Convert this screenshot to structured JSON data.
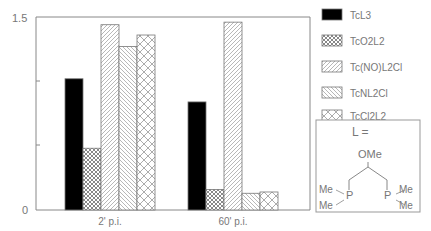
{
  "chart_data": {
    "type": "bar",
    "title": "",
    "xlabel": "",
    "ylabel": "",
    "ylim": [
      0,
      1.5
    ],
    "yticks": [
      0,
      0.5,
      1.0,
      1.5
    ],
    "ytick_labels": [
      "0",
      "",
      "",
      "1.5"
    ],
    "categories": [
      "2' p.i.",
      "60' p.i."
    ],
    "series": [
      {
        "name": "TcL3",
        "pattern": "solid-black",
        "values": [
          1.02,
          0.84
        ]
      },
      {
        "name": "TcO2L2",
        "pattern": "fine-crosshatch",
        "values": [
          0.48,
          0.16
        ]
      },
      {
        "name": "Tc(NO)L2Cl",
        "pattern": "forward-diagonal",
        "values": [
          1.44,
          1.46
        ]
      },
      {
        "name": "TcNL2Cl",
        "pattern": "backward-diagonal",
        "values": [
          1.27,
          0.13
        ]
      },
      {
        "name": "TcCl2L2",
        "pattern": "coarse-crosshatch",
        "values": [
          1.36,
          0.14
        ]
      }
    ],
    "legend_position": "right",
    "grid": false
  },
  "legend": {
    "items": [
      {
        "label": "TcL3"
      },
      {
        "label": "TcO2L2"
      },
      {
        "label": "Tc(NO)L2Cl"
      },
      {
        "label": "TcNL2Cl"
      },
      {
        "label": "TcCl2L2"
      }
    ]
  },
  "ligand_box": {
    "title": "L =",
    "ome": "OMe",
    "me_labels": [
      "Me",
      "Me",
      "Me",
      "Me"
    ],
    "p_label": "P"
  },
  "axis": {
    "y_top_label": "1.5",
    "y_bottom_label": "0",
    "x_labels": [
      "2' p.i.",
      "60' p.i."
    ]
  },
  "colors": {
    "axis": "#888888",
    "bar_stroke": "#777777",
    "solid": "#000000",
    "text": "#666666"
  }
}
